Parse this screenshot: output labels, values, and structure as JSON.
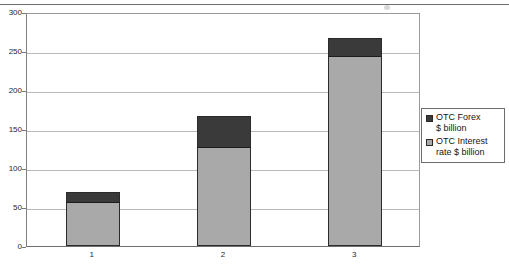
{
  "chart_data": {
    "type": "bar",
    "subtype": "stacked-column",
    "title": "",
    "xlabel": "",
    "ylabel": "",
    "categories": [
      "1",
      "2",
      "3"
    ],
    "ylim": [
      0,
      300
    ],
    "yticks": [
      0,
      50,
      100,
      150,
      200,
      250,
      300
    ],
    "ytick_labels": [
      "0",
      "50",
      "100",
      "150",
      "200",
      "250",
      "300"
    ],
    "grid": true,
    "grid_axis": "y",
    "legend_position": "right",
    "series": [
      {
        "name": "OTC Interest rate $ billion",
        "color": "#a9a9a9",
        "values": [
          55,
          126,
          242
        ]
      },
      {
        "name": "OTC Forex $ billion",
        "color": "#3a3a3a",
        "values": [
          14,
          41,
          25
        ]
      }
    ],
    "totals": [
      69,
      167,
      267
    ],
    "annotations": []
  },
  "axes": {
    "y_ticks": [
      {
        "label": "300",
        "value": 300
      },
      {
        "label": "250",
        "value": 250
      },
      {
        "label": "200",
        "value": 200
      },
      {
        "label": "150",
        "value": 150
      },
      {
        "label": "100",
        "value": 100
      },
      {
        "label": "50",
        "value": 50
      },
      {
        "label": "0",
        "value": 0
      }
    ],
    "x_categories": [
      {
        "label": "1"
      },
      {
        "label": "2"
      },
      {
        "label": "3"
      }
    ]
  },
  "legend": {
    "entries": [
      {
        "label": "OTC Forex\n$ billion",
        "color": "#3a3a3a",
        "swatch_name": "legend-swatch-otc-forex"
      },
      {
        "label": "OTC Interest\nrate $ billion",
        "color": "#a9a9a9",
        "swatch_name": "legend-swatch-otc-interest-rate"
      }
    ]
  },
  "colors": {
    "series_gray": "#a9a9a9",
    "series_dark": "#3a3a3a",
    "gridline": "#b9b9b9",
    "axis": "#6e6e6e",
    "background": "#ffffff"
  }
}
